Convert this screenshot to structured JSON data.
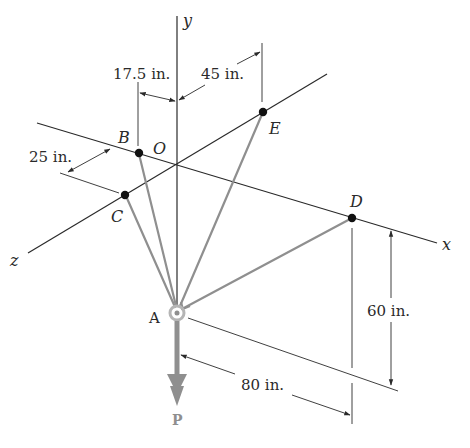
{
  "figure": {
    "axes": {
      "x": "x",
      "y": "y",
      "z": "z"
    },
    "points": {
      "origin": "O",
      "A": "A",
      "B": "B",
      "C": "C",
      "D": "D",
      "E": "E"
    },
    "force_label": "P",
    "dimensions": {
      "b_offset": "17.5 in.",
      "e_offset": "45 in.",
      "c_offset": "25 in.",
      "d_height": "60 in.",
      "d_distance": "80 in."
    },
    "colors": {
      "lines": "#2a2a2a",
      "cables": "#8f8f8f",
      "points": "#111111"
    }
  }
}
